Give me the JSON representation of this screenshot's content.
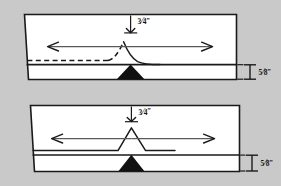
{
  "figure": {
    "background_color": "#c9c9c9",
    "panel_color": "#ffffff",
    "line_color": "#1a1a1a",
    "arrow_color": "#5a5a5a",
    "fill_triangle_color": "#111111"
  },
  "panels": [
    {
      "id": "top-panel",
      "name": "upper-joint-diagram",
      "profile_style": "curved",
      "has_dashed_reference": true,
      "root_opening": {
        "value": "3/4",
        "unit": "\"",
        "numerator": "3",
        "denominator": "4",
        "label": "3/4\"",
        "position": "top-center",
        "leader": "vertical-arrow-up"
      },
      "thickness": {
        "value": "5/8",
        "unit": "\"",
        "numerator": "5",
        "denominator": "8",
        "label": "5/8\"",
        "position": "right-side",
        "marker": "i-beam-extension"
      },
      "flow_arrows": [
        {
          "direction": "left",
          "name": "left-flow-arrow"
        },
        {
          "direction": "right",
          "name": "right-flow-arrow"
        }
      ],
      "weld_bead": {
        "shape": "triangle",
        "name": "weld-bead-triangle"
      }
    },
    {
      "id": "bottom-panel",
      "name": "lower-joint-diagram",
      "profile_style": "angular",
      "has_dashed_reference": false,
      "root_opening": {
        "value": "3/4",
        "unit": "\"",
        "numerator": "3",
        "denominator": "4",
        "label": "3/4\"",
        "position": "top-center",
        "leader": "vertical-arrow-up"
      },
      "thickness": {
        "value": "5/8",
        "unit": "\"",
        "numerator": "5",
        "denominator": "8",
        "label": "5/8\"",
        "position": "right-side",
        "marker": "i-beam-extension"
      },
      "flow_arrows": [
        {
          "direction": "left",
          "name": "left-flow-arrow"
        },
        {
          "direction": "right",
          "name": "right-flow-arrow"
        }
      ],
      "weld_bead": {
        "shape": "triangle",
        "name": "weld-bead-triangle"
      }
    }
  ]
}
